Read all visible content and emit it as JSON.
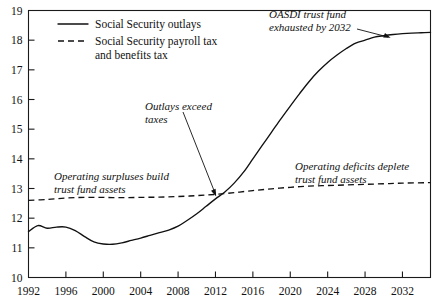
{
  "chart_data": {
    "type": "line",
    "title": "",
    "xlabel": "",
    "ylabel": "",
    "xlim": [
      1992,
      2035
    ],
    "ylim": [
      10,
      19
    ],
    "grid": false,
    "legend_position": "top-left",
    "x_ticks": [
      1992,
      1996,
      2000,
      2004,
      2008,
      2012,
      2016,
      2020,
      2024,
      2028,
      2032
    ],
    "x_tick_labels": [
      "1992",
      "1996",
      "2000",
      "2004",
      "2008",
      "2012",
      "2016",
      "2020",
      "2024",
      "2028",
      "2032"
    ],
    "y_ticks": [
      10,
      11,
      12,
      13,
      14,
      15,
      16,
      17,
      18,
      19
    ],
    "y_tick_labels": [
      "10",
      "11",
      "12",
      "13",
      "14",
      "15",
      "16",
      "17",
      "18",
      "19"
    ],
    "series": [
      {
        "name": "Social Security outlays",
        "style": "solid",
        "x": [
          1992,
          1993,
          1994,
          1995,
          1996,
          1997,
          1998,
          1999,
          2000,
          2001,
          2002,
          2003,
          2004,
          2005,
          2006,
          2007,
          2008,
          2009,
          2010,
          2011,
          2012,
          2013,
          2014,
          2015,
          2016,
          2017,
          2018,
          2019,
          2020,
          2021,
          2022,
          2023,
          2024,
          2025,
          2026,
          2027,
          2028,
          2029,
          2030,
          2031,
          2032,
          2033,
          2034,
          2035
        ],
        "values": [
          11.55,
          11.75,
          11.66,
          11.7,
          11.7,
          11.58,
          11.38,
          11.2,
          11.13,
          11.12,
          11.17,
          11.25,
          11.33,
          11.42,
          11.51,
          11.6,
          11.73,
          11.93,
          12.15,
          12.4,
          12.65,
          12.88,
          13.18,
          13.55,
          14.0,
          14.45,
          14.9,
          15.35,
          15.78,
          16.2,
          16.6,
          16.95,
          17.25,
          17.5,
          17.72,
          17.9,
          18.0,
          18.1,
          18.15,
          18.19,
          18.22,
          18.24,
          18.25,
          18.26
        ]
      },
      {
        "name": "Social Security payroll tax and benefits tax",
        "style": "dashed",
        "x": [
          1992,
          1994,
          1996,
          1998,
          2000,
          2002,
          2004,
          2006,
          2008,
          2010,
          2012,
          2014,
          2016,
          2018,
          2020,
          2022,
          2024,
          2026,
          2028,
          2030,
          2032,
          2035
        ],
        "values": [
          12.6,
          12.63,
          12.68,
          12.7,
          12.7,
          12.69,
          12.7,
          12.71,
          12.73,
          12.76,
          12.8,
          12.86,
          12.93,
          12.99,
          13.04,
          13.08,
          13.1,
          13.12,
          13.14,
          13.16,
          13.18,
          13.2
        ]
      }
    ],
    "legend": [
      {
        "label": "Social Security outlays",
        "style": "solid"
      },
      {
        "label": "Social Security payroll tax and benefits tax",
        "style": "dashed"
      }
    ],
    "annotations": [
      {
        "id": "oasdi-exhausted",
        "lines": [
          "OASDI trust fund",
          "exhausted by 2032"
        ],
        "style": "italic",
        "has_arrow": true,
        "points_to_year": 2031,
        "points_to_value": 18.1
      },
      {
        "id": "outlays-exceed-taxes",
        "lines": [
          "Outlays exceed",
          "taxes"
        ],
        "style": "italic",
        "has_arrow": true,
        "points_to_year": 2013,
        "points_to_value": 12.85
      },
      {
        "id": "operating-surpluses",
        "lines": [
          "Operating surpluses build",
          "trust fund assets"
        ],
        "style": "italic",
        "has_arrow": false
      },
      {
        "id": "operating-deficits",
        "lines": [
          "Operating deficits deplete",
          "trust fund assets"
        ],
        "style": "italic",
        "has_arrow": false
      }
    ]
  },
  "legend": {
    "outlays_label": "Social Security outlays",
    "taxes_label_line1": "Social Security payroll tax",
    "taxes_label_line2": "and benefits tax"
  },
  "annotations": {
    "oasdi_line1": "OASDI trust fund",
    "oasdi_line2": "exhausted by 2032",
    "outlays_exceed_line1": "Outlays exceed",
    "outlays_exceed_line2": "taxes",
    "surpluses_line1": "Operating surpluses build",
    "surpluses_line2": "trust fund assets",
    "deficits_line1": "Operating deficits deplete",
    "deficits_line2": "trust fund assets"
  },
  "colors": {
    "line": "#111111",
    "frame": "#1a1a1a",
    "background": "#ffffff"
  }
}
